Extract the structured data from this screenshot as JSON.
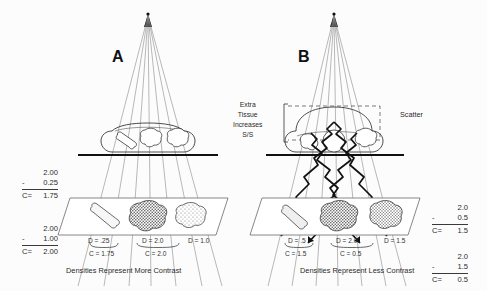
{
  "figure": {
    "panels": [
      {
        "id": "A",
        "letter": "A",
        "caption": "Densities Represent More Contrast",
        "densities": [
          {
            "label": "D = .25"
          },
          {
            "label": "D = 2.0"
          },
          {
            "label": "D = 1.0"
          }
        ],
        "contrasts": [
          {
            "label": "C = 1.75"
          },
          {
            "label": "C = 2.0"
          }
        ],
        "calculations": [
          {
            "minuend": "2.00",
            "operator": "-",
            "subtrahend": "0.25",
            "result_label": "C=",
            "result": "1.75"
          },
          {
            "minuend": "2.00",
            "operator": "-",
            "subtrahend": "1.00",
            "result_label": "C=",
            "result": "2.00"
          }
        ]
      },
      {
        "id": "B",
        "letter": "B",
        "caption": "Densities Represent Less Contrast",
        "densities": [
          {
            "label": "D = .5"
          },
          {
            "label": "D = 2.0"
          },
          {
            "label": "D = 1.5"
          }
        ],
        "contrasts": [
          {
            "label": "C = 1.5"
          },
          {
            "label": "C = 0.5"
          }
        ],
        "calculations": [
          {
            "minuend": "2.0",
            "operator": "-",
            "subtrahend": "0.5",
            "result_label": "C=",
            "result": "1.5"
          },
          {
            "minuend": "2.0",
            "operator": "-",
            "subtrahend": "1.5",
            "result_label": "C=",
            "result": "0.5"
          }
        ],
        "annotations": [
          {
            "name": "extra-tissue",
            "lines": [
              "Extra",
              "Tissue",
              "Increases",
              "S/S"
            ],
            "text": "Extra\nTissue\nIncreases\nS/S"
          },
          {
            "name": "scatter",
            "text": "Scatter"
          }
        ]
      }
    ]
  },
  "colors": {
    "ink": "#1a1a1a",
    "line": "#555555",
    "beam": "#777777",
    "scatter": "#111111",
    "table_line": "#6a6a6a",
    "background": "#fcfcfc",
    "dense_fill": "#9a9a9a",
    "light_fill": "#d8d8d8"
  },
  "icons": {
    "bone": "bone-icon",
    "dense-blob": "dense-tissue-icon",
    "light-blob": "light-tissue-icon",
    "xray-source": "xray-source-icon"
  }
}
